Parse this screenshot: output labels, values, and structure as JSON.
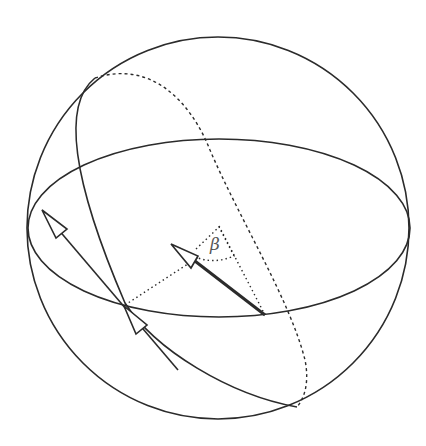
{
  "diagram": {
    "type": "sphere-with-great-circles",
    "labels": {
      "angle": "β"
    },
    "colors": {
      "stroke": "#2b2b2b",
      "label": "#555555",
      "background": "#ffffff"
    },
    "elements": [
      "outer-sphere-outline",
      "equator-ellipse",
      "tilted-great-circle-front",
      "tilted-great-circle-back-dashed",
      "vector-on-sphere-surface",
      "vector-at-center",
      "dotted-projection-lines",
      "angle-beta-arc"
    ]
  }
}
